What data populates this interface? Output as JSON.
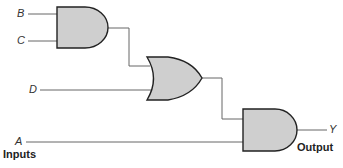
{
  "diagram": {
    "type": "logic-circuit",
    "inputs": [
      {
        "name": "B",
        "label": "B"
      },
      {
        "name": "C",
        "label": "C"
      },
      {
        "name": "D",
        "label": "D"
      },
      {
        "name": "A",
        "label": "A"
      }
    ],
    "gates": [
      {
        "id": "and1",
        "type": "AND",
        "inputs": [
          "B",
          "C"
        ]
      },
      {
        "id": "or1",
        "type": "OR",
        "inputs": [
          "and1",
          "D"
        ]
      },
      {
        "id": "and2",
        "type": "AND",
        "inputs": [
          "or1",
          "A"
        ]
      }
    ],
    "output": {
      "name": "Y",
      "label": "Y"
    },
    "inputs_caption": "Inputs",
    "output_caption": "Output",
    "colors": {
      "gate_fill": "#cfcfcf",
      "stroke": "#222222",
      "wire": "#666666"
    }
  }
}
